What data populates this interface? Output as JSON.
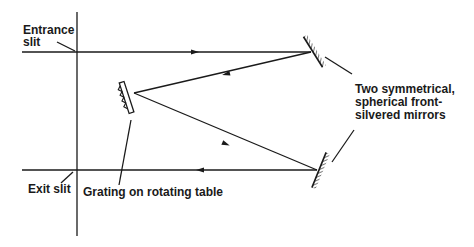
{
  "diagram": {
    "type": "optical-schematic",
    "labels": {
      "entrance_slit": "Entrance\nslit",
      "exit_slit": "Exit slit",
      "grating": "Grating on rotating table",
      "mirrors": "Two symmetrical,\nspherical front-\nsilvered mirrors"
    },
    "components": [
      {
        "id": "entrance-slit",
        "label": "Entrance slit"
      },
      {
        "id": "exit-slit",
        "label": "Exit slit"
      },
      {
        "id": "grating",
        "label": "Grating on rotating table"
      },
      {
        "id": "mirror-top",
        "label": "Two symmetrical, spherical front-silvered mirrors"
      },
      {
        "id": "mirror-bottom",
        "label": "Two symmetrical, spherical front-silvered mirrors"
      }
    ],
    "beam_path": [
      {
        "from": "entrance-slit",
        "to": "mirror-top",
        "direction": "right"
      },
      {
        "from": "mirror-top",
        "to": "grating",
        "direction": "left"
      },
      {
        "from": "grating",
        "to": "mirror-bottom",
        "direction": "right"
      },
      {
        "from": "mirror-bottom",
        "to": "exit-slit",
        "direction": "left"
      }
    ],
    "colors": {
      "ink": "#1a1a1a",
      "background": "#ffffff"
    }
  }
}
